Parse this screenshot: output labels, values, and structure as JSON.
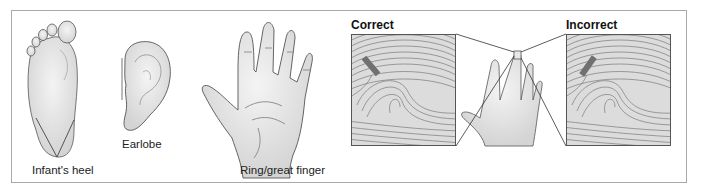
{
  "figure": {
    "sites": [
      {
        "id": "heel",
        "label": "Infant's heel",
        "icon": "foot-sole-icon"
      },
      {
        "id": "earlobe",
        "label": "Earlobe",
        "icon": "ear-icon"
      },
      {
        "id": "finger",
        "label": "Ring/great finger",
        "icon": "hand-palm-icon"
      }
    ],
    "comparison": {
      "correct": {
        "label": "Correct",
        "lancet_orientation": "perpendicular to fingerprint whorls"
      },
      "incorrect": {
        "label": "Incorrect",
        "lancet_orientation": "parallel to fingerprint whorls"
      },
      "center_icon": "hand-with-highlighted-fingertip-icon"
    }
  },
  "colors": {
    "frame_border": "#a9a9a9",
    "skin_fill": "#e6e6e6",
    "skin_outline": "#555555",
    "fingerprint_bg": "#dcdcdc",
    "fingerprint_lines": "#7a7a7a",
    "lancet_mark": "#707070"
  }
}
